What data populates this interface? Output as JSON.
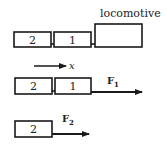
{
  "diagram": {
    "row1": {
      "cars": [
        {
          "label": "2"
        },
        {
          "label": "1"
        }
      ],
      "locomotive_label": "locomotive",
      "axis_label": "x"
    },
    "row2": {
      "cars": [
        {
          "label": "2"
        },
        {
          "label": "1"
        }
      ],
      "force": {
        "letter": "F",
        "subscript": "1"
      }
    },
    "row3": {
      "cars": [
        {
          "label": "2"
        }
      ],
      "force": {
        "letter": "F",
        "subscript": "2"
      }
    },
    "colors": {
      "stroke": "#1a1a1a",
      "background": "#ffffff"
    }
  }
}
